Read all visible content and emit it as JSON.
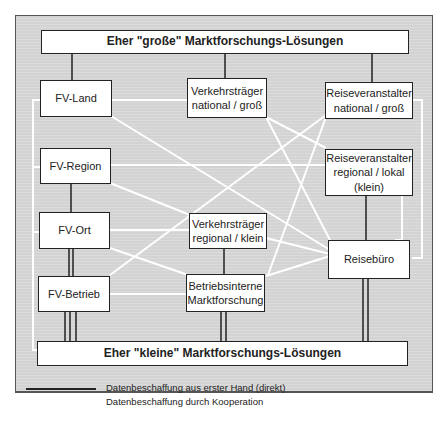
{
  "diagram": {
    "top_bar": "Eher \"große\" Marktforschungs-Lösungen",
    "bottom_bar": "Eher \"kleine\" Marktforschungs-Lösungen",
    "nodes": {
      "fv_land": "FV-Land",
      "fv_region": "FV-Region",
      "fv_ort": "FV-Ort",
      "fv_betrieb": "FV-Betrieb",
      "vt_national": "Verkehrsträger\nnational / groß",
      "vt_regional": "Verkehrsträger\nregional / klein",
      "betriebsintern": "Betriebsinterne\nMarktforschung",
      "rv_national": "Reiseveranstalter\nnational / groß",
      "rv_regional": "Reiseveranstalter\nregional / lokal\n(klein)",
      "reisebuero": "Reisebüro"
    },
    "legend": [
      {
        "label": "Datenbeschaffung aus erster Hand (direkt)",
        "color": "#222222"
      },
      {
        "label": "Datenbeschaffung durch Kooperation",
        "color": "#ffffff"
      }
    ],
    "colors": {
      "background": "#d3d3d3",
      "direct_line": "#222222",
      "cooperation_line": "#ffffff"
    }
  }
}
